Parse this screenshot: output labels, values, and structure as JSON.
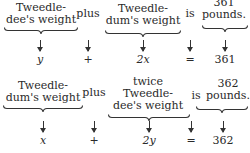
{
  "equations": [
    {
      "phrases": [
        {
          "lines": [
            "Tweedle-",
            "dee's weight"
          ]
        },
        {
          "lines": [
            "plus"
          ]
        },
        {
          "lines": [
            "twice",
            "Tweedle-",
            "dum's weight"
          ]
        },
        {
          "lines": [
            "is"
          ]
        },
        {
          "lines": [
            "361",
            "pounds."
          ]
        }
      ],
      "symbols": [
        "y",
        "+",
        "2x",
        "=",
        "361"
      ]
    },
    {
      "phrases": [
        {
          "lines": [
            "Tweedle-",
            "dum's weight"
          ]
        },
        {
          "lines": [
            "plus"
          ]
        },
        {
          "lines": [
            "twice",
            "Tweedle-",
            "dee's weight"
          ]
        },
        {
          "lines": [
            "is"
          ]
        },
        {
          "lines": [
            "362",
            "pounds."
          ]
        }
      ],
      "symbols": [
        "x",
        "+",
        "2y",
        "=",
        "362"
      ]
    }
  ],
  "arrow_glyph": "↓"
}
